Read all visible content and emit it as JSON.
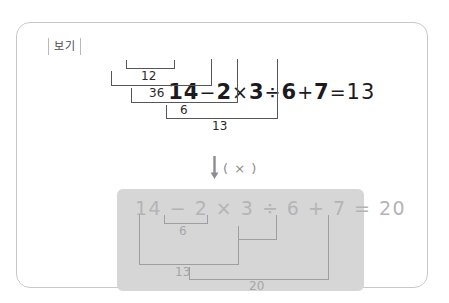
{
  "frame": {
    "tab_label": "보기"
  },
  "top_problem": {
    "expression": "14 − 2 × 3 ÷ 6 + 7 = 13",
    "tokens": [
      {
        "t": "14",
        "k": "num"
      },
      {
        "t": "−",
        "k": "op"
      },
      {
        "t": "2",
        "k": "num"
      },
      {
        "t": "×",
        "k": "op"
      },
      {
        "t": "3",
        "k": "num"
      },
      {
        "t": "÷",
        "k": "op"
      },
      {
        "t": "6",
        "k": "num"
      },
      {
        "t": "+",
        "k": "op"
      },
      {
        "t": "7",
        "k": "num"
      },
      {
        "t": "=",
        "k": "op"
      },
      {
        "t": "13",
        "k": "num"
      }
    ],
    "steps": [
      {
        "label": "12",
        "order": 1
      },
      {
        "label": "36",
        "order": 2
      },
      {
        "label": "6",
        "order": 3
      },
      {
        "label": "13",
        "order": 4
      }
    ]
  },
  "transition": {
    "arrow": "down-arrow",
    "mark": "( × )"
  },
  "answer_box": {
    "expression": "14 − 2 × 3 ÷ 6 + 7 = 20",
    "steps": [
      {
        "label": "6",
        "order": 1
      },
      {
        "label": "13",
        "order": 2
      },
      {
        "label": "20",
        "order": 3
      }
    ]
  },
  "colors": {
    "frame_border": "#c9c9cc",
    "ink": "#1b1b1f",
    "rule": "#55555a",
    "gray_box_bg": "#d6d6d6",
    "gray_ink": "#b4b4b8",
    "gray_rule": "#9d9da2",
    "marker": "#8c8c92"
  }
}
